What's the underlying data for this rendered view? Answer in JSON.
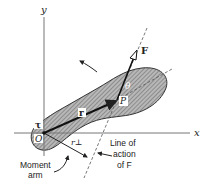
{
  "figure": {
    "axes": {
      "x_label": "x",
      "y_label": "y"
    },
    "points": {
      "origin_label": "O",
      "point_label": "P"
    },
    "vectors": {
      "position_label": "r",
      "force_label": "F",
      "torque_label": "τ",
      "angle_label": "θ",
      "moment_arm_symbol": "r⊥"
    },
    "annotations": {
      "moment_arm_line1": "Moment",
      "moment_arm_line2": "arm",
      "line_of_action_line1": "Line of",
      "line_of_action_line2": "action",
      "line_of_action_line3": "of F"
    },
    "colors": {
      "body_fill": "#9a9a9a",
      "line": "#222222",
      "axis": "#777777",
      "dashed": "#555555"
    }
  }
}
